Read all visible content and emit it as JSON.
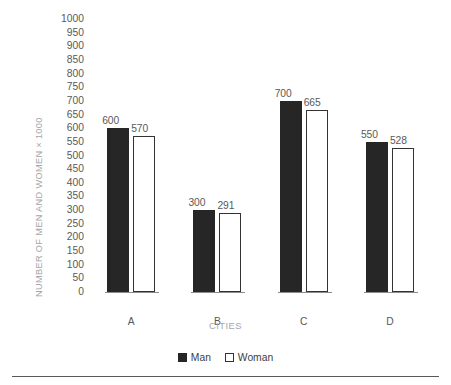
{
  "chart_data": {
    "type": "bar",
    "title": "",
    "subtitle": "",
    "xlabel": "CITIES",
    "ylabel": "NUMBER OF MEN AND WOMEN × 1000",
    "categories": [
      "A",
      "B",
      "C",
      "D"
    ],
    "series": [
      {
        "name": "Man",
        "values": [
          600,
          300,
          700,
          550
        ],
        "color": "#262626",
        "fill": "solid"
      },
      {
        "name": "Woman",
        "values": [
          570,
          291,
          665,
          528
        ],
        "color": "#ffffff",
        "fill": "outline"
      }
    ],
    "ylim": [
      0,
      1000
    ],
    "ytick_step": 50,
    "yticks": [
      0,
      50,
      100,
      150,
      200,
      250,
      300,
      350,
      400,
      450,
      500,
      550,
      600,
      650,
      700,
      750,
      800,
      850,
      900,
      950,
      1000
    ],
    "ytick_labels": [
      "0",
      "50",
      "100",
      "150",
      "200",
      "250",
      "300",
      "350",
      "400",
      "450",
      "500",
      "550",
      "600",
      "650",
      "700",
      "750",
      "800",
      "850",
      "900",
      "950",
      "1000"
    ],
    "data_labels": {
      "A": {
        "Man": "600",
        "Woman": "570"
      },
      "B": {
        "Man": "300",
        "Woman": "291"
      },
      "C": {
        "Man": "700",
        "Woman": "665"
      },
      "D": {
        "Man": "550",
        "Woman": "528"
      }
    },
    "grid": false,
    "axis_lines": false,
    "legend_position": "bottom-center",
    "legend_entries": [
      "Man",
      "Woman"
    ],
    "annotations": []
  },
  "axes": {
    "y_title": "NUMBER OF MEN AND WOMEN × 1000",
    "x_title": "CITIES"
  },
  "legend": {
    "man_label": "Man",
    "woman_label": "Woman"
  },
  "colors": {
    "man_fill": "#262626",
    "woman_fill": "#ffffff",
    "woman_stroke": "#333333",
    "tick_text": "#595959",
    "axis_title_text": "#a6a6a6",
    "rule": "#595959"
  }
}
